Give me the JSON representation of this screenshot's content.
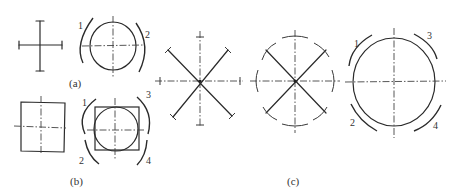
{
  "figure": {
    "panels": [
      {
        "id": "a",
        "caption": "(a)",
        "arc_labels": [
          "1",
          "2"
        ]
      },
      {
        "id": "b",
        "caption": "(b)",
        "arc_labels": [
          "1",
          "2",
          "3",
          "4"
        ]
      },
      {
        "id": "c",
        "caption": "(c)",
        "arc_labels": [
          "1",
          "2",
          "3",
          "4"
        ]
      }
    ],
    "colors": {
      "ink": "#2a2a2a",
      "background": "#ffffff"
    }
  }
}
